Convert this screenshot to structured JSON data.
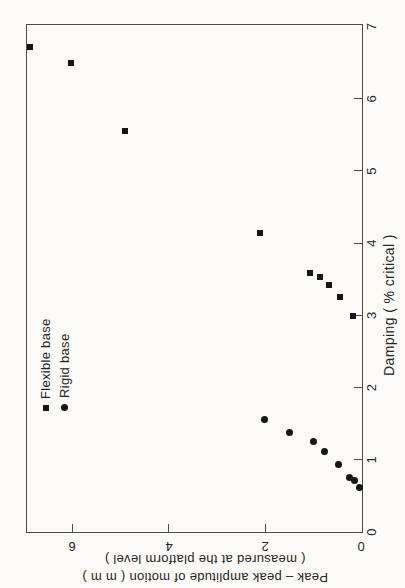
{
  "chart_data": {
    "type": "scatter",
    "title": "",
    "xlabel": "Damping ( % critical )",
    "ylabel": "Peak – peak amplitude of motion ( m m )",
    "ylabel_line2": "( measured at the platform level )",
    "xlim": [
      0,
      7
    ],
    "ylim": [
      0,
      7
    ],
    "x_ticks": [
      0,
      1,
      2,
      3,
      4,
      5,
      6,
      7
    ],
    "y_ticks": [
      0,
      2,
      4,
      6
    ],
    "grid": "off",
    "legend_position": "upper-left-inside",
    "orientation": "figure-rotated-90deg-ccw",
    "series": [
      {
        "name": "Flexible base",
        "marker": "square",
        "points": [
          [
            2.99,
            0.19
          ],
          [
            3.25,
            0.45
          ],
          [
            3.42,
            0.68
          ],
          [
            3.53,
            0.87
          ],
          [
            3.59,
            1.08
          ],
          [
            4.14,
            2.12
          ],
          [
            5.55,
            4.9
          ],
          [
            6.5,
            6.02
          ],
          [
            6.72,
            6.88
          ]
        ]
      },
      {
        "name": "Rigid base",
        "marker": "circle",
        "points": [
          [
            0.61,
            0.06
          ],
          [
            0.71,
            0.15
          ],
          [
            0.76,
            0.26
          ],
          [
            0.93,
            0.48
          ],
          [
            1.12,
            0.77
          ],
          [
            1.25,
            1.0
          ],
          [
            1.38,
            1.5
          ],
          [
            1.56,
            2.02
          ]
        ]
      }
    ]
  },
  "legend": {
    "items": [
      {
        "label": "Flexible base",
        "marker": "square"
      },
      {
        "label": "Rigid base",
        "marker": "circle"
      }
    ]
  },
  "colors": {
    "marker": "#161616",
    "axis_line": "#4d4d4d",
    "text": "#262626",
    "background": "#fbfaf7"
  }
}
